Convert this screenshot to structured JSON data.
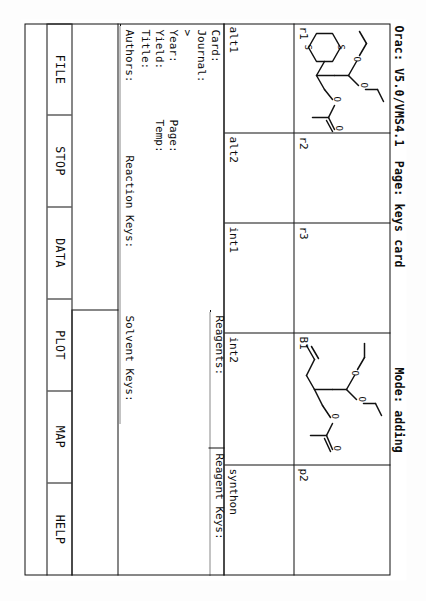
{
  "app": {
    "title_line": "Orac: V5.0/VMS4.1  Page: keys card              Mode: adding",
    "program": "Orac:",
    "version": "V5.0/VMS4.1",
    "page_label": "Page:",
    "page_value": "keys card",
    "mode_label": "Mode:",
    "mode_value": "adding"
  },
  "structure_row": {
    "cells": [
      {
        "id": "r1",
        "corner_label": "r1",
        "has_structure": true,
        "structure": "dithiane-acetal-ester"
      },
      {
        "id": "r2",
        "corner_label": "r2",
        "has_structure": false,
        "structure": ""
      },
      {
        "id": "r3",
        "corner_label": "r3",
        "has_structure": false,
        "structure": ""
      },
      {
        "id": "b1",
        "corner_label": "B1",
        "has_structure": true,
        "structure": "allyl-acetal-ester"
      },
      {
        "id": "p2",
        "corner_label": "p2",
        "has_structure": false,
        "structure": ""
      }
    ]
  },
  "label_row": {
    "cells": [
      {
        "label": "alt1"
      },
      {
        "label": "alt2"
      },
      {
        "label": "int1"
      },
      {
        "label": "int2"
      },
      {
        "label": "synthon"
      }
    ]
  },
  "data_panel": {
    "left_fields": [
      {
        "label": "Card:",
        "value": ""
      },
      {
        "label": "Journal:",
        "value": ""
      },
      {
        "label": ">",
        "value": ""
      },
      {
        "label": "Year:",
        "value": ""
      },
      {
        "label": "Yield:",
        "value": ""
      },
      {
        "label": "Title:",
        "value": ""
      }
    ],
    "inline_fields": [
      {
        "label": "Page:",
        "value": ""
      },
      {
        "label": "Temp:",
        "value": ""
      }
    ],
    "key_fields": [
      {
        "label": "Authors:",
        "value": ""
      },
      {
        "label": "Reaction Keys:",
        "value": ""
      },
      {
        "label": "Solvent Keys:",
        "value": ""
      },
      {
        "label": "Reagents:",
        "value": ""
      },
      {
        "label": "Reagent Keys:",
        "value": ""
      }
    ]
  },
  "menu": {
    "items": [
      {
        "label": "FILE"
      },
      {
        "label": "STOP"
      },
      {
        "label": "DATA"
      },
      {
        "label": "PLOT"
      },
      {
        "label": "MAP"
      },
      {
        "label": "HELP"
      }
    ]
  },
  "colors": {
    "ink": "#0d0d0d",
    "paper": "#ffffff",
    "rule": "#111111"
  }
}
